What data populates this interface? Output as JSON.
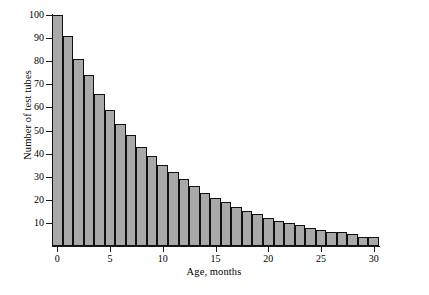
{
  "chart_data": {
    "type": "bar",
    "title": "",
    "subtitle": "",
    "xlabel": "Age, months",
    "ylabel": "Number of test tubes",
    "xlim": [
      -0.5,
      30.5
    ],
    "ylim": [
      0,
      100
    ],
    "grid": false,
    "legend": null,
    "bar_fill_color": "#a9a9a9",
    "bar_edge_color": "#111111",
    "axis_color": "#1a1a1a",
    "background_color": "#ffffff",
    "xticks": [
      0,
      5,
      10,
      15,
      20,
      25,
      30
    ],
    "xtick_labels": [
      "0",
      "5",
      "10",
      "15",
      "20",
      "25",
      "30"
    ],
    "yticks": [
      10,
      20,
      30,
      40,
      50,
      60,
      70,
      80,
      90,
      100
    ],
    "ytick_labels": [
      "10",
      "20",
      "30",
      "40",
      "50",
      "60",
      "70",
      "80",
      "90",
      "100"
    ],
    "categories": [
      0,
      1,
      2,
      3,
      4,
      5,
      6,
      7,
      8,
      9,
      10,
      11,
      12,
      13,
      14,
      15,
      16,
      17,
      18,
      19,
      20,
      21,
      22,
      23,
      24,
      25,
      26,
      27,
      28,
      29,
      30
    ],
    "values": [
      100,
      91,
      81,
      74,
      66,
      59,
      53,
      48,
      43,
      39,
      35,
      32,
      29,
      26,
      23,
      21,
      19,
      17,
      15,
      14,
      12,
      11,
      10,
      9,
      8,
      7,
      6,
      6,
      5,
      4,
      4
    ]
  }
}
